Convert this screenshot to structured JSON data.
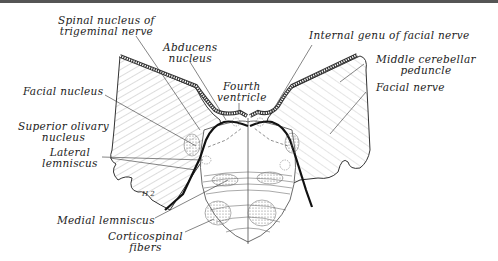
{
  "figure": {
    "labels": {
      "spinal_nucleus": "Spinal nucleus of trigeminal nerve",
      "spinal_nucleus_l1": "Spinal nucleus of",
      "spinal_nucleus_l2": "trigeminal nerve",
      "abducens_l1": "Abducens",
      "abducens_l2": "nucleus",
      "fourth_l1": "Fourth",
      "fourth_l2": "ventricle",
      "internal_genu": "Internal genu of facial nerve",
      "middle_cerebellar_l1": "Middle cerebellar",
      "middle_cerebellar_l2": "peduncle",
      "facial_nerve": "Facial nerve",
      "facial_nucleus": "Facial nucleus",
      "superior_olivary_l1": "Superior olivary",
      "superior_olivary_l2": "nucleus",
      "lateral_lemniscus_l1": "Lateral",
      "lateral_lemniscus_l2": "lemniscus",
      "medial_lemniscus": "Medial lemniscus",
      "corticospinal_l1": "Corticospinal",
      "corticospinal_l2": "fibers",
      "small_mark": "H 2"
    }
  }
}
